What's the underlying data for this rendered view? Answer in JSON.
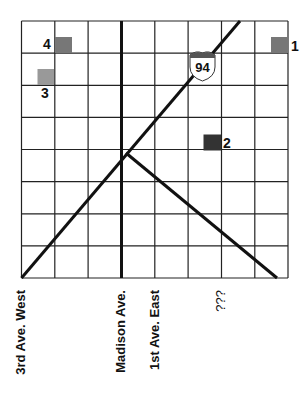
{
  "map": {
    "grid": {
      "left": 21.5,
      "top": 21,
      "right": 288,
      "bottom": 278,
      "columns": 8,
      "rows": 8,
      "line_color": "#222222"
    },
    "streets": [
      {
        "label": "3rd Ave. West",
        "x": 21.5
      },
      {
        "label": "Madison Ave.",
        "x": 121.5
      },
      {
        "label": "1st Ave. East",
        "x": 155
      },
      {
        "label": "???",
        "x": 221.5
      }
    ],
    "highway": {
      "number": "94",
      "shield_color": "#555555"
    },
    "markers": [
      {
        "id": "1",
        "label": "1",
        "color": "#777777"
      },
      {
        "id": "2",
        "label": "2",
        "color": "#333333"
      },
      {
        "id": "3",
        "label": "3",
        "color": "#999999"
      },
      {
        "id": "4",
        "label": "4",
        "color": "#777777"
      }
    ]
  }
}
